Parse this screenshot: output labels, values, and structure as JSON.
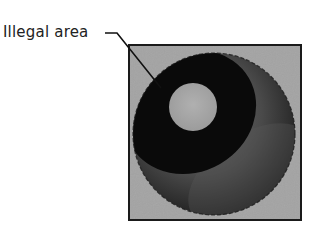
{
  "figure": {
    "callout_label": "Illegal area",
    "colors": {
      "background": "#a3a3a3",
      "frame": "#1a1a1a",
      "illegal_ring": "#0a0a0a",
      "highlight": "#a8a8a8",
      "sphere_light": "#7a7a7a",
      "sphere_dark": "#1c1c1c"
    }
  }
}
